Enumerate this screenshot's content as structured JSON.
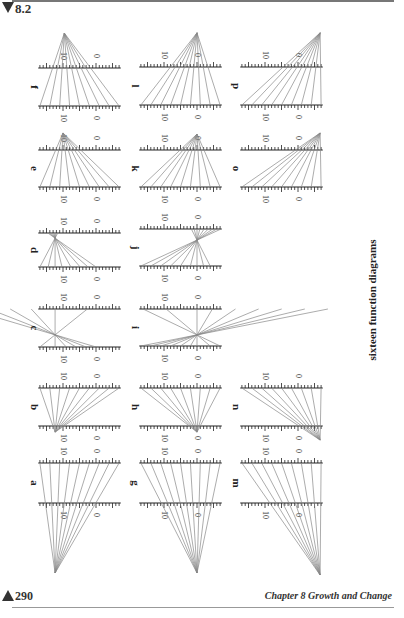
{
  "header": {
    "section": "8.2"
  },
  "footer": {
    "page_number": "290",
    "chapter": "Chapter 8  Growth and Change"
  },
  "caption": "sixteen function diagrams",
  "scale": {
    "px_per_unit": 3.3,
    "tick_labels": [
      "10",
      "0"
    ]
  },
  "columns": {
    "c1": {
      "zero_x": 96
    },
    "c2": {
      "zero_x": 197
    },
    "c3": {
      "zero_x": 298
    }
  },
  "diagrams": [
    {
      "label": "f",
      "col": "c1",
      "top_y": 68,
      "bottom_y": 106,
      "apex": [
        9.6,
        1.92
      ],
      "hits": [
        17,
        14,
        11,
        8,
        5,
        2,
        -1,
        -4,
        -7
      ]
    },
    {
      "label": "e",
      "col": "c1",
      "top_y": 150,
      "bottom_y": 187,
      "apex": [
        10,
        1.46
      ],
      "hits": [
        17,
        14,
        11,
        8,
        5,
        2,
        -1,
        -4,
        -7
      ]
    },
    {
      "label": "d",
      "col": "c1",
      "top_y": 233,
      "bottom_y": 267,
      "apex": [
        12.4,
        0.85
      ],
      "hits": [
        17,
        14.5,
        12.4,
        10.3,
        7.6,
        4.8,
        2.4,
        0
      ]
    },
    {
      "label": "c",
      "col": "c1",
      "top_y": 309,
      "bottom_y": 347,
      "apex": [
        12.4,
        0.32
      ],
      "hits": [
        17,
        12.4,
        9,
        6,
        3,
        0
      ]
    },
    {
      "label": "b",
      "col": "c1",
      "top_y": 388,
      "bottom_y": 426,
      "apex": [
        12.4,
        -0.16
      ],
      "hits": [
        17,
        14,
        11,
        8,
        5,
        2,
        -1,
        -4,
        -7
      ]
    },
    {
      "label": "a",
      "col": "c1",
      "top_y": 463,
      "bottom_y": 503,
      "apex": [
        12.4,
        -1.75
      ],
      "hits": [
        17,
        14,
        11,
        8,
        5,
        2,
        -1,
        -4,
        -7
      ]
    },
    {
      "label": "l",
      "col": "c2",
      "top_y": 67,
      "bottom_y": 105,
      "apex": [
        0,
        1.9
      ],
      "hits": [
        17,
        14,
        11,
        8,
        5,
        2,
        -1,
        -4,
        -7
      ]
    },
    {
      "label": "k",
      "col": "c2",
      "top_y": 150,
      "bottom_y": 187,
      "apex": [
        0,
        1.43
      ],
      "hits": [
        17,
        14,
        11,
        8,
        5,
        2,
        -1,
        -4,
        -7
      ]
    },
    {
      "label": "j",
      "col": "c2",
      "top_y": 229,
      "bottom_y": 266,
      "apex": [
        0,
        0.7
      ],
      "hits": [
        17,
        14,
        11,
        8,
        5,
        2,
        0,
        -2,
        -4
      ]
    },
    {
      "label": "i",
      "col": "c2",
      "top_y": 309,
      "bottom_y": 346,
      "apex": [
        0,
        0.3
      ],
      "hits": [
        17,
        14,
        11,
        8,
        5,
        2,
        0,
        -4,
        -7
      ]
    },
    {
      "label": "h",
      "col": "c2",
      "top_y": 388,
      "bottom_y": 426,
      "apex": [
        0,
        -0.16
      ],
      "hits": [
        17,
        14,
        11,
        8,
        5,
        2,
        -1,
        -4,
        -7
      ]
    },
    {
      "label": "g",
      "col": "c2",
      "top_y": 463,
      "bottom_y": 503,
      "apex": [
        0,
        -1.75
      ],
      "hits": [
        17,
        14,
        11,
        8,
        5,
        2,
        -1,
        -4,
        -7
      ]
    },
    {
      "label": "p",
      "col": "c3",
      "top_y": 67,
      "bottom_y": 105,
      "apex": [
        -6.7,
        1.9
      ],
      "hits": [
        17,
        14,
        11,
        8,
        5,
        2,
        -1,
        -4,
        -7
      ]
    },
    {
      "label": "o",
      "col": "c3",
      "top_y": 150,
      "bottom_y": 187,
      "apex": [
        -6.7,
        1.46
      ],
      "hits": [
        17,
        14,
        11,
        8,
        5,
        2,
        -1,
        -4,
        -7
      ]
    },
    {
      "label": "n",
      "col": "c3",
      "top_y": 388,
      "bottom_y": 426,
      "apex": [
        -6.7,
        -0.37
      ],
      "hits": [
        17,
        14,
        11,
        8,
        5,
        2,
        -1,
        -4,
        -7
      ]
    },
    {
      "label": "m",
      "col": "c3",
      "top_y": 463,
      "bottom_y": 503,
      "apex": [
        -6.7,
        -1.8
      ],
      "hits": [
        17,
        14,
        11,
        8,
        5,
        2,
        -1,
        -4,
        -7
      ]
    }
  ]
}
